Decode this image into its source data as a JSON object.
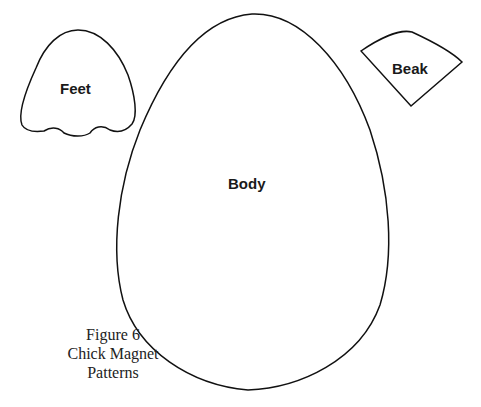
{
  "pieces": {
    "feet": {
      "label": "Feet"
    },
    "beak": {
      "label": "Beak"
    },
    "body": {
      "label": "Body"
    }
  },
  "caption": {
    "line1": "Figure 6",
    "line2": "Chick Magnet",
    "line3": "Patterns"
  },
  "colors": {
    "outline": "#111111",
    "background": "#ffffff"
  }
}
